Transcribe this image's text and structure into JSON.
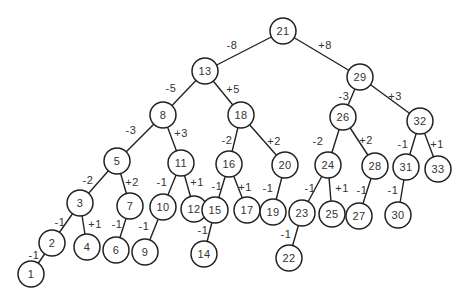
{
  "diagram": {
    "type": "binary-search-tree",
    "node_radius": 13,
    "nodes": [
      {
        "id": "21",
        "label": "21",
        "x": 283,
        "y": 31
      },
      {
        "id": "13",
        "label": "13",
        "x": 205,
        "y": 71
      },
      {
        "id": "29",
        "label": "29",
        "x": 360,
        "y": 77
      },
      {
        "id": "8",
        "label": "8",
        "x": 163,
        "y": 115
      },
      {
        "id": "18",
        "label": "18",
        "x": 241,
        "y": 115
      },
      {
        "id": "26",
        "label": "26",
        "x": 343,
        "y": 117
      },
      {
        "id": "32",
        "label": "32",
        "x": 420,
        "y": 121
      },
      {
        "id": "5",
        "label": "5",
        "x": 117,
        "y": 161
      },
      {
        "id": "11",
        "label": "11",
        "x": 181,
        "y": 163
      },
      {
        "id": "16",
        "label": "16",
        "x": 229,
        "y": 164
      },
      {
        "id": "20",
        "label": "20",
        "x": 285,
        "y": 165
      },
      {
        "id": "24",
        "label": "24",
        "x": 328,
        "y": 165
      },
      {
        "id": "28",
        "label": "28",
        "x": 375,
        "y": 166
      },
      {
        "id": "31",
        "label": "31",
        "x": 406,
        "y": 167
      },
      {
        "id": "33",
        "label": "33",
        "x": 438,
        "y": 169
      },
      {
        "id": "3",
        "label": "3",
        "x": 80,
        "y": 203
      },
      {
        "id": "7",
        "label": "7",
        "x": 130,
        "y": 206
      },
      {
        "id": "10",
        "label": "10",
        "x": 163,
        "y": 207
      },
      {
        "id": "12",
        "label": "12",
        "x": 194,
        "y": 209
      },
      {
        "id": "15",
        "label": "15",
        "x": 215,
        "y": 210
      },
      {
        "id": "17",
        "label": "17",
        "x": 247,
        "y": 210
      },
      {
        "id": "19",
        "label": "19",
        "x": 273,
        "y": 212
      },
      {
        "id": "23",
        "label": "23",
        "x": 302,
        "y": 213
      },
      {
        "id": "25",
        "label": "25",
        "x": 332,
        "y": 214
      },
      {
        "id": "27",
        "label": "27",
        "x": 359,
        "y": 216
      },
      {
        "id": "30",
        "label": "30",
        "x": 398,
        "y": 215
      },
      {
        "id": "2",
        "label": "2",
        "x": 52,
        "y": 243
      },
      {
        "id": "4",
        "label": "4",
        "x": 87,
        "y": 247
      },
      {
        "id": "6",
        "label": "6",
        "x": 116,
        "y": 250
      },
      {
        "id": "9",
        "label": "9",
        "x": 145,
        "y": 252
      },
      {
        "id": "14",
        "label": "14",
        "x": 204,
        "y": 254
      },
      {
        "id": "22",
        "label": "22",
        "x": 289,
        "y": 258
      },
      {
        "id": "1",
        "label": "1",
        "x": 31,
        "y": 274
      }
    ],
    "edges": [
      {
        "from": "21",
        "to": "13",
        "label": "-8",
        "lx": 232,
        "ly": 45
      },
      {
        "from": "21",
        "to": "29",
        "label": "+8",
        "lx": 325,
        "ly": 45
      },
      {
        "from": "13",
        "to": "8",
        "label": "-5",
        "lx": 171,
        "ly": 88
      },
      {
        "from": "13",
        "to": "18",
        "label": "+5",
        "lx": 233,
        "ly": 89
      },
      {
        "from": "29",
        "to": "26",
        "label": "-3",
        "lx": 344,
        "ly": 96
      },
      {
        "from": "29",
        "to": "32",
        "label": "+3",
        "lx": 395,
        "ly": 96
      },
      {
        "from": "8",
        "to": "5",
        "label": "-3",
        "lx": 131,
        "ly": 130
      },
      {
        "from": "8",
        "to": "11",
        "label": "+3",
        "lx": 181,
        "ly": 133
      },
      {
        "from": "18",
        "to": "16",
        "label": "-2",
        "lx": 227,
        "ly": 140
      },
      {
        "from": "18",
        "to": "20",
        "label": "+2",
        "lx": 274,
        "ly": 141
      },
      {
        "from": "26",
        "to": "24",
        "label": "-2",
        "lx": 318,
        "ly": 141
      },
      {
        "from": "26",
        "to": "28",
        "label": "+2",
        "lx": 366,
        "ly": 140
      },
      {
        "from": "32",
        "to": "31",
        "label": "-1",
        "lx": 403,
        "ly": 144
      },
      {
        "from": "32",
        "to": "33",
        "label": "+1",
        "lx": 437,
        "ly": 144
      },
      {
        "from": "5",
        "to": "3",
        "label": "-2",
        "lx": 88,
        "ly": 180
      },
      {
        "from": "5",
        "to": "7",
        "label": "+2",
        "lx": 132,
        "ly": 182
      },
      {
        "from": "11",
        "to": "10",
        "label": "-1",
        "lx": 162,
        "ly": 182
      },
      {
        "from": "11",
        "to": "12",
        "label": "+1",
        "lx": 197,
        "ly": 182
      },
      {
        "from": "16",
        "to": "15",
        "label": "-1",
        "lx": 217,
        "ly": 186
      },
      {
        "from": "16",
        "to": "17",
        "label": "+1",
        "lx": 245,
        "ly": 187
      },
      {
        "from": "20",
        "to": "19",
        "label": "-1",
        "lx": 268,
        "ly": 188
      },
      {
        "from": "24",
        "to": "23",
        "label": "-1",
        "lx": 310,
        "ly": 188
      },
      {
        "from": "24",
        "to": "25",
        "label": "+1",
        "lx": 342,
        "ly": 188
      },
      {
        "from": "28",
        "to": "27",
        "label": "-1",
        "lx": 362,
        "ly": 190
      },
      {
        "from": "31",
        "to": "30",
        "label": "-1",
        "lx": 393,
        "ly": 190
      },
      {
        "from": "3",
        "to": "2",
        "label": "-1",
        "lx": 60,
        "ly": 222
      },
      {
        "from": "3",
        "to": "4",
        "label": "+1",
        "lx": 95,
        "ly": 224
      },
      {
        "from": "7",
        "to": "6",
        "label": "-1",
        "lx": 117,
        "ly": 224
      },
      {
        "from": "10",
        "to": "9",
        "label": "-1",
        "lx": 144,
        "ly": 226
      },
      {
        "from": "15",
        "to": "14",
        "label": "-1",
        "lx": 203,
        "ly": 230
      },
      {
        "from": "23",
        "to": "22",
        "label": "-1",
        "lx": 286,
        "ly": 234
      },
      {
        "from": "2",
        "to": "1",
        "label": "-1",
        "lx": 34,
        "ly": 255
      }
    ]
  }
}
